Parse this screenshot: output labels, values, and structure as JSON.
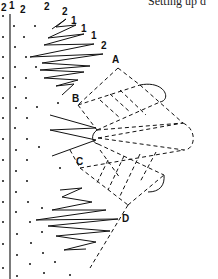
{
  "caption": "Setting up d",
  "diagram": {
    "type": "bobbin-lace-pricking",
    "top_labels": [
      {
        "text": "2",
        "x": 1,
        "y": 11
      },
      {
        "text": "1",
        "x": 9,
        "y": 9
      },
      {
        "text": "2",
        "x": 20,
        "y": 13
      },
      {
        "text": "2",
        "x": 44,
        "y": 10
      },
      {
        "text": "2",
        "x": 62,
        "y": 15
      },
      {
        "text": "1",
        "x": 71,
        "y": 24
      },
      {
        "text": "1",
        "x": 81,
        "y": 32
      },
      {
        "text": "1",
        "x": 91,
        "y": 39
      },
      {
        "text": "2",
        "x": 101,
        "y": 49
      }
    ],
    "point_labels": [
      {
        "text": "A",
        "x": 112,
        "y": 63
      },
      {
        "text": "B",
        "x": 72,
        "y": 102
      },
      {
        "text": "C",
        "x": 76,
        "y": 165
      },
      {
        "text": "D",
        "x": 122,
        "y": 222
      }
    ],
    "colors": {
      "ink": "#111111",
      "background": "#ffffff"
    }
  }
}
